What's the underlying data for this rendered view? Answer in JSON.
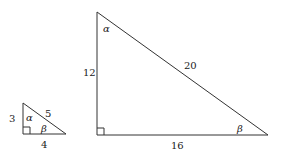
{
  "small_triangle": {
    "side_vertical": "3",
    "side_horizontal": "4",
    "hypotenuse": "5",
    "angle_top": "α",
    "angle_right": "β"
  },
  "large_triangle": {
    "side_vertical": "12",
    "side_horizontal": "16",
    "hypotenuse": "20",
    "angle_top": "α",
    "angle_right": "β"
  }
}
